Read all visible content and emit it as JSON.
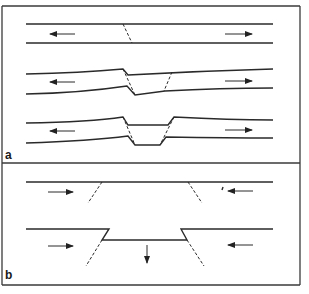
{
  "figure": {
    "panels": [
      {
        "label": "a",
        "description": "Extension: a layer pulled apart along normal faults forming a graben",
        "stages": [
          {
            "name": "initial",
            "faults": 1,
            "arrows": [
              "left",
              "right"
            ]
          },
          {
            "name": "faulted",
            "faults": 2,
            "arrows": [
              "left",
              "right"
            ]
          },
          {
            "name": "graben",
            "faults": 2,
            "arrows": [
              "left",
              "right"
            ]
          }
        ]
      },
      {
        "label": "b",
        "description": "Compression: layer pushed together with central block moving down",
        "stages": [
          {
            "name": "initial",
            "faults": 2,
            "arrows": [
              "right",
              "left"
            ]
          },
          {
            "name": "subsided-block",
            "faults": 2,
            "arrows": [
              "right",
              "left",
              "down"
            ]
          }
        ]
      }
    ],
    "colors": {
      "line": "#2a2a2a",
      "background": "#ffffff",
      "frame": "#3a3a3a"
    }
  }
}
